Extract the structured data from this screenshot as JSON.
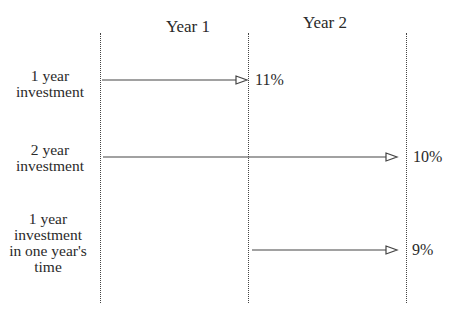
{
  "headers": {
    "year1": "Year 1",
    "year2": "Year 2"
  },
  "rows": [
    {
      "label_lines": [
        "1 year",
        "investment"
      ],
      "rate": "11%"
    },
    {
      "label_lines": [
        "2 year",
        "investment"
      ],
      "rate": "10%"
    },
    {
      "label_lines": [
        "1 year",
        "investment",
        "in one year's",
        "time"
      ],
      "rate": "9%"
    }
  ],
  "colors": {
    "line": "#444444",
    "text": "#2a2a2a"
  }
}
